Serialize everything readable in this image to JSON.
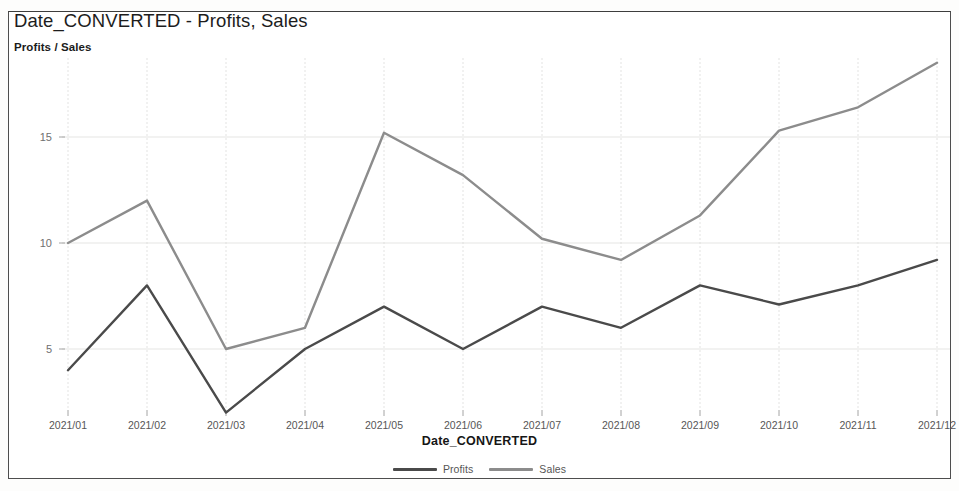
{
  "chart": {
    "title": "Date_CONVERTED - Profits, Sales",
    "y_axis_title": "Profits / Sales",
    "x_axis_title": "Date_CONVERTED"
  },
  "legend": {
    "items": [
      {
        "label": "Profits",
        "color": "#4a4a4a"
      },
      {
        "label": "Sales",
        "color": "#8c8c8c"
      }
    ]
  },
  "chart_data": {
    "type": "line",
    "title": "Date_CONVERTED - Profits, Sales",
    "xlabel": "Date_CONVERTED",
    "ylabel": "Profits / Sales",
    "categories": [
      "2021/01",
      "2021/02",
      "2021/03",
      "2021/04",
      "2021/05",
      "2021/06",
      "2021/07",
      "2021/08",
      "2021/09",
      "2021/10",
      "2021/11",
      "2021/12"
    ],
    "series": [
      {
        "name": "Profits",
        "color": "#4a4a4a",
        "values": [
          4,
          8,
          2,
          5,
          7,
          5,
          7,
          6,
          8,
          7.1,
          8,
          9.2
        ]
      },
      {
        "name": "Sales",
        "color": "#8c8c8c",
        "values": [
          10,
          12,
          5,
          6,
          15.2,
          13.2,
          10.2,
          9.2,
          11.3,
          15.3,
          16.4,
          18.5
        ]
      }
    ],
    "y_ticks": [
      5,
      10,
      15
    ],
    "ylim": [
      0,
      20.2
    ],
    "grid": true,
    "legend_position": "bottom"
  }
}
